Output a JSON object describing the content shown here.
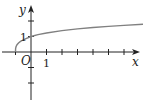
{
  "diagram": {
    "type": "function-graph",
    "axes": {
      "x_label": "x",
      "y_label": "y",
      "origin_label": "O",
      "x_tick_label": "1",
      "y_tick_label": "1",
      "x_ticks": [
        -1,
        1,
        2,
        3,
        4,
        5,
        6
      ],
      "y_ticks": [
        -3,
        -2,
        -1,
        1,
        2
      ]
    },
    "curve": {
      "description": "increasing concave curve starting at (-1, 0), passing through (0, 1)",
      "start_point": [
        -1,
        0
      ],
      "key_point": [
        0,
        1
      ],
      "x_range": [
        -1,
        7.2
      ],
      "color": "#808080"
    },
    "colors": {
      "axis": "#222222",
      "curve": "#808080"
    }
  }
}
